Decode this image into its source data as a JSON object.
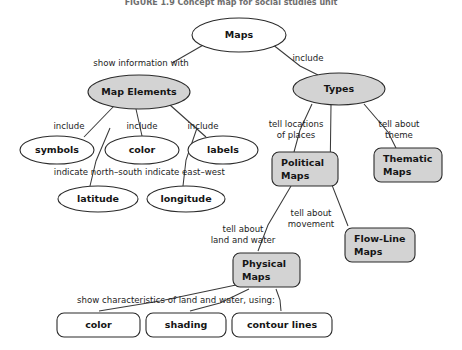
{
  "figure": {
    "title": "FIGURE 1.9  Concept map for social studies unit",
    "title_x": 231,
    "title_y": 5
  },
  "nodes": [
    {
      "id": "maps",
      "label": "Maps",
      "shape": "ellipse",
      "fill": "plain",
      "cx": 239,
      "cy": 35,
      "rx": 47,
      "ry": 17,
      "align": "center",
      "lines": [
        "Maps"
      ]
    },
    {
      "id": "map-elements",
      "label": "Map Elements",
      "shape": "ellipse",
      "fill": "filled",
      "cx": 139,
      "cy": 92,
      "rx": 51,
      "ry": 17,
      "align": "center",
      "lines": [
        "Map Elements"
      ]
    },
    {
      "id": "types",
      "label": "Types",
      "shape": "ellipse",
      "fill": "filled",
      "cx": 339,
      "cy": 89,
      "rx": 46,
      "ry": 16,
      "align": "center",
      "lines": [
        "Types"
      ]
    },
    {
      "id": "symbols",
      "label": "symbols",
      "shape": "ellipse",
      "fill": "plain",
      "cx": 57,
      "cy": 150,
      "rx": 37,
      "ry": 14,
      "align": "center",
      "lines": [
        "symbols"
      ]
    },
    {
      "id": "color-elem",
      "label": "color",
      "shape": "ellipse",
      "fill": "plain",
      "cx": 142,
      "cy": 150,
      "rx": 37,
      "ry": 14,
      "align": "center",
      "lines": [
        "color"
      ]
    },
    {
      "id": "labels",
      "label": "labels",
      "shape": "ellipse",
      "fill": "plain",
      "cx": 223,
      "cy": 150,
      "rx": 35,
      "ry": 14,
      "align": "center",
      "lines": [
        "labels"
      ]
    },
    {
      "id": "latitude",
      "label": "latitude",
      "shape": "ellipse",
      "fill": "plain",
      "cx": 98,
      "cy": 199,
      "rx": 40,
      "ry": 13,
      "align": "center",
      "lines": [
        "latitude"
      ]
    },
    {
      "id": "longitude",
      "label": "longitude",
      "shape": "ellipse",
      "fill": "plain",
      "cx": 186,
      "cy": 199,
      "rx": 39,
      "ry": 13,
      "align": "center",
      "lines": [
        "longitude"
      ]
    },
    {
      "id": "political-maps",
      "label": "Political Maps",
      "shape": "rect",
      "fill": "filled",
      "x": 272,
      "y": 152,
      "w": 66,
      "h": 34,
      "r": 7,
      "align": "left",
      "lines": [
        "Political",
        "Maps"
      ]
    },
    {
      "id": "thematic-maps",
      "label": "Thematic Maps",
      "shape": "rect",
      "fill": "filled",
      "x": 374,
      "y": 148,
      "w": 68,
      "h": 34,
      "r": 7,
      "align": "left",
      "lines": [
        "Thematic",
        "Maps"
      ]
    },
    {
      "id": "flow-line-maps",
      "label": "Flow-Line Maps",
      "shape": "rect",
      "fill": "filled",
      "x": 345,
      "y": 228,
      "w": 70,
      "h": 34,
      "r": 7,
      "align": "left",
      "lines": [
        "Flow-Line",
        "Maps"
      ]
    },
    {
      "id": "physical-maps",
      "label": "Physical Maps",
      "shape": "rect",
      "fill": "filled",
      "x": 233,
      "y": 253,
      "w": 67,
      "h": 34,
      "r": 7,
      "align": "left",
      "lines": [
        "Physical",
        "Maps"
      ]
    },
    {
      "id": "color-bottom",
      "label": "color",
      "shape": "rect",
      "fill": "plain",
      "x": 57,
      "y": 313,
      "w": 83,
      "h": 24,
      "r": 7,
      "align": "center",
      "lines": [
        "color"
      ]
    },
    {
      "id": "shading",
      "label": "shading",
      "shape": "rect",
      "fill": "plain",
      "x": 146,
      "y": 313,
      "w": 80,
      "h": 24,
      "r": 7,
      "align": "center",
      "lines": [
        "shading"
      ]
    },
    {
      "id": "contour-lines",
      "label": "contour lines",
      "shape": "rect",
      "fill": "plain",
      "x": 232,
      "y": 313,
      "w": 100,
      "h": 24,
      "r": 7,
      "align": "center",
      "lines": [
        "contour lines"
      ]
    }
  ],
  "links": [
    {
      "id": "maps-to-map-elements",
      "path": "M 205 44 L 172 63",
      "label_lines": [
        "show information with"
      ],
      "label_x": 141,
      "label_y": 66
    },
    {
      "id": "maps-to-types",
      "path": "M 272 44 L 300 66 L 318 75",
      "label_lines": [
        "include"
      ],
      "label_x": 308,
      "label_y": 61
    },
    {
      "id": "map-elements-to-symbols",
      "path": "M 114 106 L 84 137",
      "label_lines": [
        "include"
      ],
      "label_x": 69,
      "label_y": 129
    },
    {
      "id": "map-elements-to-color",
      "path": "M 136 109 L 142 136",
      "label_lines": [
        "include"
      ],
      "label_x": 142,
      "label_y": 129
    },
    {
      "id": "map-elements-to-labels",
      "path": "M 170 105 L 206 137",
      "label_lines": [
        "include"
      ],
      "label_x": 203,
      "label_y": 129
    },
    {
      "id": "symbols-to-latitude",
      "path": "M 110 128 L 96 161 L 90 186",
      "label_lines": [
        "indicate north–south"
      ],
      "label_x": 98,
      "label_y": 175
    },
    {
      "id": "labels-to-longitude",
      "path": "M 197 128 L 186 160 L 183 186",
      "label_lines": [
        "indicate east–west"
      ],
      "label_x": 185,
      "label_y": 175
    },
    {
      "id": "types-to-political",
      "path": "M 312 104 L 300 130 L 294 152",
      "label_lines": [
        "tell locations",
        "of places"
      ],
      "label_x": 296,
      "label_y": 127
    },
    {
      "id": "types-to-thematic",
      "path": "M 364 104 L 388 132 L 396 148",
      "label_lines": [
        "tell about",
        "theme"
      ],
      "label_x": 399,
      "label_y": 127
    },
    {
      "id": "types-to-flow-line",
      "path": "M 331 105 L 330 180 L 348 226",
      "label_lines": [
        "tell about",
        "movement"
      ],
      "label_x": 311,
      "label_y": 216
    },
    {
      "id": "political-to-physical",
      "path": "M 291 186 L 268 225 L 258 251",
      "label_lines": [
        "tell about",
        "land and water"
      ],
      "label_x": 243,
      "label_y": 232
    },
    {
      "id": "physical-to-color",
      "path": "M 236 285 L 160 301 L 99 311",
      "label_lines": [
        "show characteristics of land and water, using:"
      ],
      "label_x": 176,
      "label_y": 303
    },
    {
      "id": "physical-to-shading",
      "path": "M 249 289 L 220 303 L 190 311",
      "label_lines": [],
      "label_x": 0,
      "label_y": 0
    },
    {
      "id": "physical-to-contour",
      "path": "M 276 289 L 280 300 L 281 311",
      "label_lines": [],
      "label_x": 0,
      "label_y": 0
    }
  ]
}
